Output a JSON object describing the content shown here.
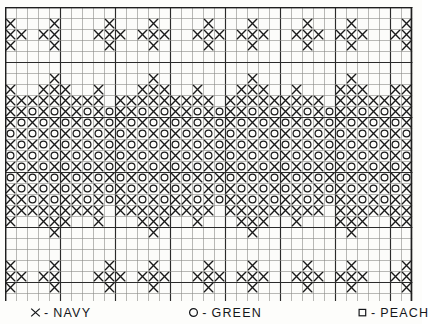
{
  "chart": {
    "type": "stitch-chart",
    "grid": {
      "columns": 37,
      "rows": 27,
      "cell_px": 11,
      "heavy_every": 5,
      "line_color_light": "#8a8a86",
      "line_color_heavy": "#2b2b2b",
      "background": "#fcfcfa"
    },
    "symbols": [
      {
        "key": "X",
        "glyph": "X",
        "color_name": "NAVY",
        "swatch": "#1b2a5e",
        "icon": "cross-x-icon"
      },
      {
        "key": "O",
        "glyph": "O",
        "color_name": "GREEN",
        "swatch": "#2f7a3e",
        "icon": "circle-o-icon"
      },
      {
        "key": "S",
        "glyph": "□",
        "color_name": "PEACH",
        "swatch": "#e8b48e",
        "icon": "square-outline-icon"
      }
    ],
    "ink_color": "#1a1a1a",
    "legend": {
      "entries": [
        {
          "symbol": "X",
          "dash": "-",
          "label": "NAVY"
        },
        {
          "symbol": "O",
          "dash": "-",
          "label": "GREEN"
        },
        {
          "symbol": "□",
          "dash": "-",
          "label": "PEACH"
        }
      ]
    },
    "bands": {
      "top_border_rows": "1-5",
      "center_motif_rows": "7-19",
      "bottom_border_rows": "22-26"
    },
    "pattern_rows": [
      ".....................................",
      "X...X....X...X....X...X....X...X....X",
      "XX.XX...XXX.XXX..XXX.XXX..XXX.XXX..XX",
      "X...X....X...X....X...X....X...X....X",
      ".....................................",
      ".....................................",
      "....X........X........X........X.....",
      "X..XXX..X...XXX..X...XXX..X...XXX..XX",
      "XXXXXXXXX.XXXXXXXXX.XXXXXXXXX.XXXXXXX",
      "XXOXOXXOXOXXOXOXXOXOXXOXOXXOXOXXOXOXX",
      "XOXOXOXOXOXOXOXOXOXOXOXOXOXOXOXOXOXOX",
      "OXOXOXOXOXOXOXOXOXOXOXOXOXOXOXOXOXOXO",
      "XOXOXOXOXOXOXOXOXOXOXOXOXOXOXOXOXOXOX",
      "OXOXOXOXOXOXOXOXOXOXOXOXOXOXOXOXOXOXO",
      "XOXOXOXOXOXOXOXOXOXOXOXOXOXOXOXOXOXOX",
      "OXOXOXOXOXOXOXOXOXOXOXOXOXOXOXOXOXOXO",
      "XOXOXOXOXOXOXOXOXOXOXOXOXOXOXOXOXOXOX",
      "XXOXOXXOXOXXOXOXXOXOXXOXOXXOXOXXOXOXX",
      "XXXXXXXXX.XXXXXXXXX.XXXXXXXXX.XXXXXXX",
      "X..XXX..X...XXX..X...XXX..X...XXX..XX",
      "....X........X........X........X.....",
      ".....................................",
      ".....................................",
      "X...X....X...X....X...X....X...X....X",
      "XX.XX...XXX.XXX..XXX.XXX..XXX.XXX..XX",
      "X...X....X...X....X...X....X...X....X",
      "....................................."
    ]
  }
}
